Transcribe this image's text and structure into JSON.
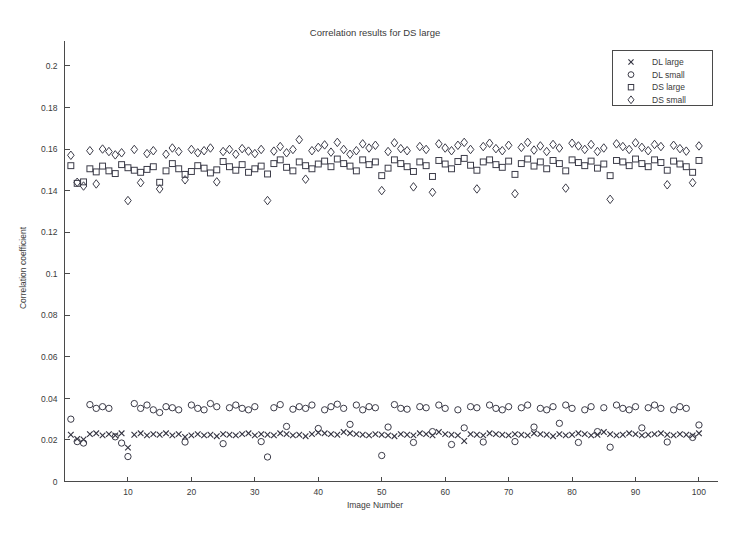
{
  "chart_data": {
    "type": "scatter",
    "title": "Correlation results for DS large",
    "xlabel": "Image Number",
    "ylabel": "Correlation coefficient",
    "xlim": [
      0,
      103
    ],
    "ylim": [
      0,
      0.212
    ],
    "grid": false,
    "legend_position": "top-right",
    "xticks": [
      10,
      20,
      30,
      40,
      50,
      60,
      70,
      80,
      90,
      100
    ],
    "xtick_labels": [
      "10",
      "20",
      "30",
      "40",
      "50",
      "60",
      "70",
      "80",
      "90",
      "100"
    ],
    "yticks": [
      0,
      0.02,
      0.04,
      0.06,
      0.08,
      0.1,
      0.12,
      0.14,
      0.16,
      0.18,
      0.2
    ],
    "ytick_labels": [
      "0",
      "0.02",
      "0.04",
      "0.06",
      "0.08",
      "0.1",
      "0.12",
      "0.14",
      "0.16",
      "0.18",
      "0.2"
    ],
    "x": [
      1,
      2,
      3,
      4,
      5,
      6,
      7,
      8,
      9,
      10,
      11,
      12,
      13,
      14,
      15,
      16,
      17,
      18,
      19,
      20,
      21,
      22,
      23,
      24,
      25,
      26,
      27,
      28,
      29,
      30,
      31,
      32,
      33,
      34,
      35,
      36,
      37,
      38,
      39,
      40,
      41,
      42,
      43,
      44,
      45,
      46,
      47,
      48,
      49,
      50,
      51,
      52,
      53,
      54,
      55,
      56,
      57,
      58,
      59,
      60,
      61,
      62,
      63,
      64,
      65,
      66,
      67,
      68,
      69,
      70,
      71,
      72,
      73,
      74,
      75,
      76,
      77,
      78,
      79,
      80,
      81,
      82,
      83,
      84,
      85,
      86,
      87,
      88,
      89,
      90,
      91,
      92,
      93,
      94,
      95,
      96,
      97,
      98,
      99,
      100
    ],
    "series": [
      {
        "name": "DL large",
        "marker": "x",
        "values": [
          0.0225,
          0.0205,
          0.0202,
          0.0228,
          0.0232,
          0.0222,
          0.0228,
          0.0222,
          0.0232,
          0.0163,
          0.0225,
          0.0232,
          0.0222,
          0.0228,
          0.0225,
          0.0232,
          0.0222,
          0.0228,
          0.0215,
          0.0222,
          0.0228,
          0.0222,
          0.0225,
          0.0218,
          0.0228,
          0.0225,
          0.0222,
          0.0228,
          0.0232,
          0.0222,
          0.0228,
          0.0225,
          0.0222,
          0.0232,
          0.0228,
          0.0222,
          0.0225,
          0.0218,
          0.0228,
          0.0235,
          0.0232,
          0.0228,
          0.0225,
          0.0238,
          0.0232,
          0.0228,
          0.0225,
          0.0222,
          0.0228,
          0.0225,
          0.0222,
          0.0218,
          0.0228,
          0.0225,
          0.0222,
          0.0232,
          0.0228,
          0.0222,
          0.0238,
          0.0228,
          0.0225,
          0.0222,
          0.0195,
          0.0228,
          0.0225,
          0.0222,
          0.0232,
          0.0228,
          0.0225,
          0.0222,
          0.0228,
          0.0225,
          0.0222,
          0.0232,
          0.0228,
          0.0225,
          0.0218,
          0.0228,
          0.0222,
          0.0225,
          0.0232,
          0.0228,
          0.0222,
          0.0225,
          0.0238,
          0.0228,
          0.0222,
          0.0225,
          0.0232,
          0.0228,
          0.0222,
          0.0225,
          0.0228,
          0.0232,
          0.0225,
          0.0222,
          0.0228,
          0.0225,
          0.0222,
          0.0232
        ]
      },
      {
        "name": "DL small",
        "marker": "o",
        "values": [
          0.03,
          0.0192,
          0.0185,
          0.037,
          0.0352,
          0.036,
          0.0352,
          0.0215,
          0.0185,
          0.012,
          0.0375,
          0.0352,
          0.0368,
          0.0345,
          0.0332,
          0.036,
          0.0355,
          0.0345,
          0.019,
          0.0368,
          0.0352,
          0.0345,
          0.0375,
          0.036,
          0.0182,
          0.0355,
          0.0368,
          0.0352,
          0.0345,
          0.036,
          0.0192,
          0.0118,
          0.0355,
          0.037,
          0.0265,
          0.0348,
          0.036,
          0.0352,
          0.0368,
          0.0255,
          0.0345,
          0.036,
          0.0372,
          0.0352,
          0.0275,
          0.0368,
          0.0345,
          0.036,
          0.0355,
          0.0125,
          0.0262,
          0.037,
          0.0352,
          0.0348,
          0.0188,
          0.036,
          0.0355,
          0.024,
          0.0368,
          0.0352,
          0.0178,
          0.0345,
          0.0258,
          0.036,
          0.0355,
          0.019,
          0.0368,
          0.0352,
          0.0345,
          0.036,
          0.0192,
          0.0355,
          0.0368,
          0.0262,
          0.0352,
          0.0345,
          0.036,
          0.028,
          0.0368,
          0.0352,
          0.0188,
          0.0345,
          0.036,
          0.024,
          0.0355,
          0.0165,
          0.0368,
          0.0352,
          0.0345,
          0.036,
          0.0258,
          0.0355,
          0.0368,
          0.0352,
          0.019,
          0.0345,
          0.036,
          0.0352,
          0.0212,
          0.0272
        ]
      },
      {
        "name": "DS large",
        "marker": "s",
        "values": [
          0.152,
          0.1435,
          0.1442,
          0.1505,
          0.149,
          0.1518,
          0.1495,
          0.1482,
          0.1525,
          0.151,
          0.1498,
          0.1488,
          0.1502,
          0.1515,
          0.144,
          0.1495,
          0.153,
          0.1505,
          0.1478,
          0.1492,
          0.152,
          0.1508,
          0.1485,
          0.15,
          0.154,
          0.1515,
          0.1498,
          0.1525,
          0.1488,
          0.1505,
          0.1518,
          0.148,
          0.153,
          0.1548,
          0.1512,
          0.1495,
          0.1538,
          0.152,
          0.1505,
          0.1528,
          0.1542,
          0.1515,
          0.1552,
          0.153,
          0.1518,
          0.1495,
          0.1548,
          0.1525,
          0.1538,
          0.1472,
          0.1508,
          0.1548,
          0.153,
          0.1515,
          0.1492,
          0.1538,
          0.152,
          0.1468,
          0.1545,
          0.1528,
          0.1505,
          0.154,
          0.1555,
          0.1522,
          0.1498,
          0.1538,
          0.1548,
          0.1525,
          0.1512,
          0.1542,
          0.1478,
          0.153,
          0.1552,
          0.1518,
          0.1538,
          0.1505,
          0.1545,
          0.153,
          0.1495,
          0.1548,
          0.1535,
          0.152,
          0.1542,
          0.1508,
          0.1528,
          0.1472,
          0.1545,
          0.1538,
          0.152,
          0.1552,
          0.153,
          0.1515,
          0.1548,
          0.1535,
          0.1498,
          0.1542,
          0.1528,
          0.1515,
          0.1488,
          0.1545
        ]
      },
      {
        "name": "DS small",
        "marker": "d",
        "values": [
          0.157,
          0.144,
          0.1422,
          0.1592,
          0.1432,
          0.16,
          0.1588,
          0.1572,
          0.1582,
          0.1352,
          0.1598,
          0.1438,
          0.1578,
          0.1592,
          0.1408,
          0.1575,
          0.1605,
          0.1588,
          0.1452,
          0.1598,
          0.1582,
          0.1592,
          0.1605,
          0.1442,
          0.1588,
          0.1598,
          0.1575,
          0.1602,
          0.159,
          0.1578,
          0.1598,
          0.1352,
          0.159,
          0.1612,
          0.1582,
          0.1598,
          0.1645,
          0.1455,
          0.1592,
          0.1608,
          0.162,
          0.1585,
          0.1632,
          0.1598,
          0.1575,
          0.1592,
          0.1625,
          0.1605,
          0.1618,
          0.14,
          0.1588,
          0.163,
          0.1602,
          0.1592,
          0.1418,
          0.1612,
          0.1598,
          0.1392,
          0.1625,
          0.1605,
          0.1592,
          0.1618,
          0.1632,
          0.1598,
          0.1408,
          0.1612,
          0.1628,
          0.1602,
          0.1592,
          0.1618,
          0.1385,
          0.1608,
          0.1632,
          0.1595,
          0.1615,
          0.1588,
          0.1622,
          0.1605,
          0.1412,
          0.1628,
          0.1615,
          0.1598,
          0.1622,
          0.1588,
          0.1605,
          0.1358,
          0.1625,
          0.1612,
          0.1598,
          0.163,
          0.1608,
          0.1592,
          0.1622,
          0.1612,
          0.1428,
          0.1618,
          0.1602,
          0.159,
          0.1438,
          0.1615
        ]
      }
    ]
  },
  "legend": {
    "entries": [
      {
        "marker": "x",
        "label": "DL large"
      },
      {
        "marker": "o",
        "label": "DL small"
      },
      {
        "marker": "s",
        "label": "DS large"
      },
      {
        "marker": "d",
        "label": "DS small"
      }
    ]
  }
}
